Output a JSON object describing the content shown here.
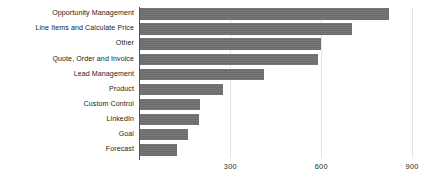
{
  "chart_data": {
    "type": "bar",
    "orientation": "horizontal",
    "title": "",
    "xlabel": "",
    "ylabel": "",
    "categories": [
      "Opportunity Management",
      "Line Items and Calculate Price",
      "Other",
      "Quote, Order and Invoice",
      "Lead Management",
      "Product",
      "Custom Control",
      "LinkedIn",
      "Goal",
      "Forecast"
    ],
    "values": [
      825,
      700,
      600,
      590,
      410,
      275,
      200,
      198,
      160,
      125
    ],
    "xticks": [
      300,
      600,
      900
    ],
    "xtick_labels": [
      "300",
      "600",
      "900"
    ],
    "xlim": [
      0,
      900
    ],
    "grid": "vertical-only",
    "legend": "none",
    "bar_color": "#6f6f6f",
    "gridline_color": "#e3e3e3",
    "axis_color": "#555555",
    "background_color": "#ffffff"
  }
}
